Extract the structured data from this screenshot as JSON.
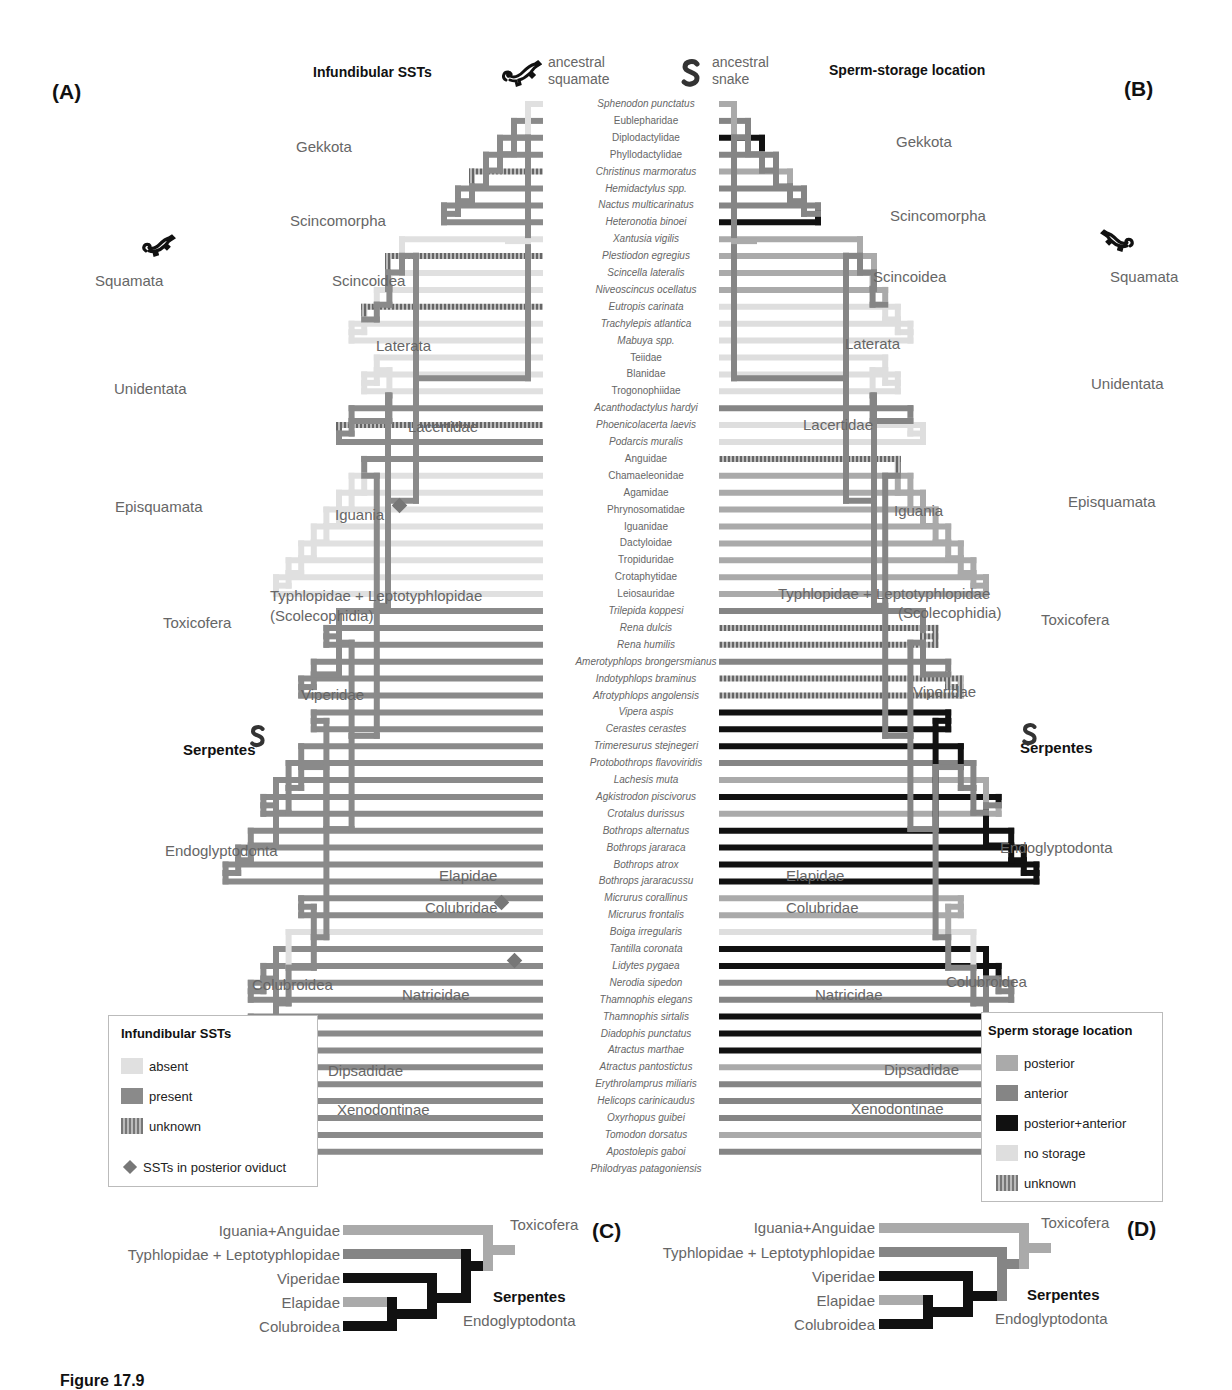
{
  "panels": {
    "A": {
      "letter": "(A)",
      "title": "Infundibular SSTs"
    },
    "B": {
      "letter": "(B)",
      "title": "Sperm-storage location"
    },
    "C": {
      "letter": "(C)"
    },
    "D": {
      "letter": "(D)"
    }
  },
  "ancestors": {
    "squamate": {
      "line1": "ancestral",
      "line2": "squamate",
      "icon": "lizard-icon"
    },
    "snake": {
      "line1": "ancestral",
      "line2": "snake",
      "icon": "snake-icon"
    }
  },
  "colors": {
    "absent": "#e0e0e0",
    "present": "#8a8a8a",
    "posterior": "#aaaaaa",
    "anterior": "#858585",
    "posterior_anterior": "#111111",
    "no_storage": "#dedede",
    "unknown": "#7a7a7a"
  },
  "tips": [
    {
      "name": "Sphenodon punctatus",
      "italic": true,
      "A": "absent",
      "B": "posterior"
    },
    {
      "name": "Eublepharidae",
      "italic": false,
      "A": "present",
      "B": "anterior"
    },
    {
      "name": "Diplodactylidae",
      "italic": false,
      "A": "present",
      "B": "posterior_anterior"
    },
    {
      "name": "Phyllodactylidae",
      "italic": false,
      "A": "present",
      "B": "anterior"
    },
    {
      "name": "Christinus marmoratus",
      "italic": true,
      "A": "unknown",
      "B": "posterior"
    },
    {
      "name": "Hemidactylus spp.",
      "italic": true,
      "A": "present",
      "B": "anterior"
    },
    {
      "name": "Nactus multicarinatus",
      "italic": true,
      "A": "present",
      "B": "anterior"
    },
    {
      "name": "Heteronotia binoei",
      "italic": true,
      "A": "present",
      "B": "posterior_anterior"
    },
    {
      "name": "Xantusia vigilis",
      "italic": true,
      "A": "absent",
      "B": "posterior"
    },
    {
      "name": "Plestiodon egregius",
      "italic": true,
      "A": "unknown",
      "B": "posterior"
    },
    {
      "name": "Scincella lateralis",
      "italic": true,
      "A": "absent",
      "B": "posterior"
    },
    {
      "name": "Niveoscincus ocellatus",
      "italic": true,
      "A": "absent",
      "B": "posterior"
    },
    {
      "name": "Eutropis carinata",
      "italic": true,
      "A": "unknown",
      "B": "no_storage"
    },
    {
      "name": "Trachylepis atlantica",
      "italic": true,
      "A": "absent",
      "B": "no_storage"
    },
    {
      "name": "Mabuya spp.",
      "italic": true,
      "A": "absent",
      "B": "no_storage"
    },
    {
      "name": "Teiidae",
      "italic": false,
      "A": "absent",
      "B": "no_storage"
    },
    {
      "name": "Blanidae",
      "italic": false,
      "A": "absent",
      "B": "no_storage"
    },
    {
      "name": "Trogonophiidae",
      "italic": false,
      "A": "absent",
      "B": "no_storage"
    },
    {
      "name": "Acanthodactylus hardyi",
      "italic": true,
      "A": "present",
      "B": "anterior"
    },
    {
      "name": "Phoenicolacerta laevis",
      "italic": true,
      "A": "unknown",
      "B": "no_storage"
    },
    {
      "name": "Podarcis muralis",
      "italic": true,
      "A": "present",
      "B": "no_storage"
    },
    {
      "name": "Anguidae",
      "italic": false,
      "A": "present",
      "B": "unknown"
    },
    {
      "name": "Chamaeleonidae",
      "italic": false,
      "A": "absent",
      "B": "posterior"
    },
    {
      "name": "Agamidae",
      "italic": false,
      "A": "absent",
      "B": "posterior"
    },
    {
      "name": "Phrynosomatidae",
      "italic": false,
      "A": "absent",
      "B": "posterior"
    },
    {
      "name": "Iguanidae",
      "italic": false,
      "A": "absent",
      "B": "posterior"
    },
    {
      "name": "Dactyloidae",
      "italic": false,
      "A": "absent",
      "B": "posterior"
    },
    {
      "name": "Tropiduridae",
      "italic": false,
      "A": "absent",
      "B": "posterior"
    },
    {
      "name": "Crotaphytidae",
      "italic": false,
      "A": "absent",
      "B": "posterior"
    },
    {
      "name": "Leiosauridae",
      "italic": false,
      "A": "absent",
      "B": "posterior"
    },
    {
      "name": "Trilepida koppesi",
      "italic": true,
      "A": "present",
      "B": "anterior"
    },
    {
      "name": "Rena dulcis",
      "italic": true,
      "A": "present",
      "B": "unknown"
    },
    {
      "name": "Rena humilis",
      "italic": true,
      "A": "present",
      "B": "unknown"
    },
    {
      "name": "Amerotyphlops brongersmianus",
      "italic": true,
      "A": "present",
      "B": "anterior"
    },
    {
      "name": "Indotyphlops braminus",
      "italic": true,
      "A": "present",
      "B": "unknown"
    },
    {
      "name": "Afrotyphlops angolensis",
      "italic": true,
      "A": "present",
      "B": "unknown"
    },
    {
      "name": "Vipera aspis",
      "italic": true,
      "A": "present",
      "B": "posterior_anterior"
    },
    {
      "name": "Cerastes cerastes",
      "italic": true,
      "A": "present",
      "B": "posterior_anterior"
    },
    {
      "name": "Trimeresurus stejnegeri",
      "italic": true,
      "A": "present",
      "B": "posterior_anterior"
    },
    {
      "name": "Protobothrops flavoviridis",
      "italic": true,
      "A": "present",
      "B": "anterior"
    },
    {
      "name": "Lachesis muta",
      "italic": true,
      "A": "present",
      "B": "posterior"
    },
    {
      "name": "Agkistrodon piscivorus",
      "italic": true,
      "A": "present",
      "B": "posterior_anterior"
    },
    {
      "name": "Crotalus durissus",
      "italic": true,
      "A": "present",
      "B": "posterior"
    },
    {
      "name": "Bothrops alternatus",
      "italic": true,
      "A": "present",
      "B": "posterior_anterior"
    },
    {
      "name": "Bothrops jararaca",
      "italic": true,
      "A": "present",
      "B": "posterior_anterior"
    },
    {
      "name": "Bothrops atrox",
      "italic": true,
      "A": "present",
      "B": "posterior_anterior"
    },
    {
      "name": "Bothrops jararacussu",
      "italic": true,
      "A": "present",
      "B": "posterior_anterior"
    },
    {
      "name": "Micrurus corallinus",
      "italic": true,
      "A": "present",
      "B": "posterior"
    },
    {
      "name": "Micrurus frontalis",
      "italic": true,
      "A": "present",
      "B": "posterior"
    },
    {
      "name": "Boiga irregularis",
      "italic": true,
      "A": "absent",
      "B": "no_storage"
    },
    {
      "name": "Tantilla coronata",
      "italic": true,
      "A": "present",
      "B": "posterior_anterior"
    },
    {
      "name": "Lidytes pygaea",
      "italic": true,
      "A": "present",
      "B": "posterior_anterior"
    },
    {
      "name": "Nerodia sipedon",
      "italic": true,
      "A": "present",
      "B": "anterior"
    },
    {
      "name": "Thamnophis elegans",
      "italic": true,
      "A": "present",
      "B": "anterior"
    },
    {
      "name": "Thamnophis sirtalis",
      "italic": true,
      "A": "present",
      "B": "posterior_anterior"
    },
    {
      "name": "Diadophis punctatus",
      "italic": true,
      "A": "present",
      "B": "posterior_anterior"
    },
    {
      "name": "Atractus marthae",
      "italic": true,
      "A": "present",
      "B": "posterior_anterior"
    },
    {
      "name": "Atractus pantostictus",
      "italic": true,
      "A": "present",
      "B": "posterior"
    },
    {
      "name": "Erythrolamprus miliaris",
      "italic": true,
      "A": "present",
      "B": "anterior"
    },
    {
      "name": "Helicops carinicaudus",
      "italic": true,
      "A": "present",
      "B": "anterior"
    },
    {
      "name": "Oxyrhopus guibei",
      "italic": true,
      "A": "present",
      "B": "anterior"
    },
    {
      "name": "Tomodon dorsatus",
      "italic": true,
      "A": "present",
      "B": "posterior"
    },
    {
      "name": "Apostolepis gaboi",
      "italic": true,
      "A": "present",
      "B": "anterior"
    },
    {
      "name": "Philodryas patagoniensis",
      "italic": true,
      "A": "present",
      "B": "posterior_anterior"
    }
  ],
  "clade_labels_A": [
    {
      "text": "Gekkota",
      "x": 296,
      "y": 148
    },
    {
      "text": "Squamata",
      "x": 95,
      "y": 282
    },
    {
      "text": "Scincomorpha",
      "x": 290,
      "y": 222
    },
    {
      "text": "Scincoidea",
      "x": 332,
      "y": 282
    },
    {
      "text": "Laterata",
      "x": 376,
      "y": 347
    },
    {
      "text": "Unidentata",
      "x": 114,
      "y": 390
    },
    {
      "text": "Lacertidae",
      "x": 408,
      "y": 428
    },
    {
      "text": "Episquamata",
      "x": 115,
      "y": 508
    },
    {
      "text": "Iguania",
      "x": 335,
      "y": 516
    },
    {
      "text": "Typhlopidae + Leptotyphlopidae",
      "x": 270,
      "y": 597
    },
    {
      "text": "(Scolecophidia)",
      "x": 270,
      "y": 617
    },
    {
      "text": "Toxicofera",
      "x": 163,
      "y": 624
    },
    {
      "text": "Viperidae",
      "x": 301,
      "y": 696
    },
    {
      "text": "Serpentes",
      "x": 183,
      "y": 751,
      "bold": true
    },
    {
      "text": "Endoglyptodonta",
      "x": 165,
      "y": 852
    },
    {
      "text": "Elapidae",
      "x": 439,
      "y": 877
    },
    {
      "text": "Colubridae",
      "x": 425,
      "y": 909
    },
    {
      "text": "Colubroidea",
      "x": 252,
      "y": 986
    },
    {
      "text": "Natricidae",
      "x": 402,
      "y": 996
    },
    {
      "text": "Dipsadidae",
      "x": 328,
      "y": 1072
    },
    {
      "text": "Xenodontinae",
      "x": 337,
      "y": 1111
    }
  ],
  "clade_labels_B": [
    {
      "text": "Gekkota",
      "x": 896,
      "y": 143
    },
    {
      "text": "Scincomorpha",
      "x": 890,
      "y": 217
    },
    {
      "text": "Squamata",
      "x": 1110,
      "y": 278
    },
    {
      "text": "Scincoidea",
      "x": 873,
      "y": 278
    },
    {
      "text": "Laterata",
      "x": 845,
      "y": 345
    },
    {
      "text": "Unidentata",
      "x": 1091,
      "y": 385
    },
    {
      "text": "Lacertidae",
      "x": 803,
      "y": 426
    },
    {
      "text": "Episquamata",
      "x": 1068,
      "y": 503
    },
    {
      "text": "Iguania",
      "x": 894,
      "y": 512
    },
    {
      "text": "Typhlopidae + Leptotyphlopidae",
      "x": 778,
      "y": 595
    },
    {
      "text": "(Scolecophidia)",
      "x": 898,
      "y": 614
    },
    {
      "text": "Toxicofera",
      "x": 1041,
      "y": 621
    },
    {
      "text": "Viperidae",
      "x": 913,
      "y": 693
    },
    {
      "text": "Serpentes",
      "x": 1020,
      "y": 749,
      "bold": true
    },
    {
      "text": "Endoglyptodonta",
      "x": 1000,
      "y": 849
    },
    {
      "text": "Elapidae",
      "x": 786,
      "y": 877
    },
    {
      "text": "Colubridae",
      "x": 786,
      "y": 909
    },
    {
      "text": "Colubroidea",
      "x": 946,
      "y": 983
    },
    {
      "text": "Natricidae",
      "x": 815,
      "y": 996
    },
    {
      "text": "Dipsadidae",
      "x": 884,
      "y": 1071
    },
    {
      "text": "Xenodontinae",
      "x": 851,
      "y": 1110
    }
  ],
  "legend_A": {
    "title": "Infundibular SSTs",
    "items": [
      {
        "label": "absent",
        "key": "absent"
      },
      {
        "label": "present",
        "key": "present"
      },
      {
        "label": "unknown",
        "key": "unknown"
      }
    ],
    "note": "SSTs in posterior oviduct"
  },
  "legend_B": {
    "title": "Sperm storage location",
    "items": [
      {
        "label": "posterior",
        "key": "posterior"
      },
      {
        "label": "anterior",
        "key": "anterior"
      },
      {
        "label": "posterior+anterior",
        "key": "posterior_anterior"
      },
      {
        "label": "no storage",
        "key": "no_storage"
      },
      {
        "label": "unknown",
        "key": "unknown"
      }
    ]
  },
  "summary_C": {
    "taxa": [
      "Iguania+Anguidae",
      "Typhlopidae + Leptotyphlopidae",
      "Viperidae",
      "Elapidae",
      "Colubroidea"
    ],
    "labels": {
      "toxicofera": "Toxicofera",
      "serpentes": "Serpentes",
      "endoglyptodonta": "Endoglyptodonta"
    }
  },
  "summary_D": {
    "taxa": [
      "Iguania+Anguidae",
      "Typhlopidae + Leptotyphlopidae",
      "Viperidae",
      "Elapidae",
      "Colubroidea"
    ],
    "labels": {
      "toxicofera": "Toxicofera",
      "serpentes": "Serpentes",
      "endoglyptodonta": "Endoglyptodonta"
    }
  },
  "caption": "Figure 17.9"
}
